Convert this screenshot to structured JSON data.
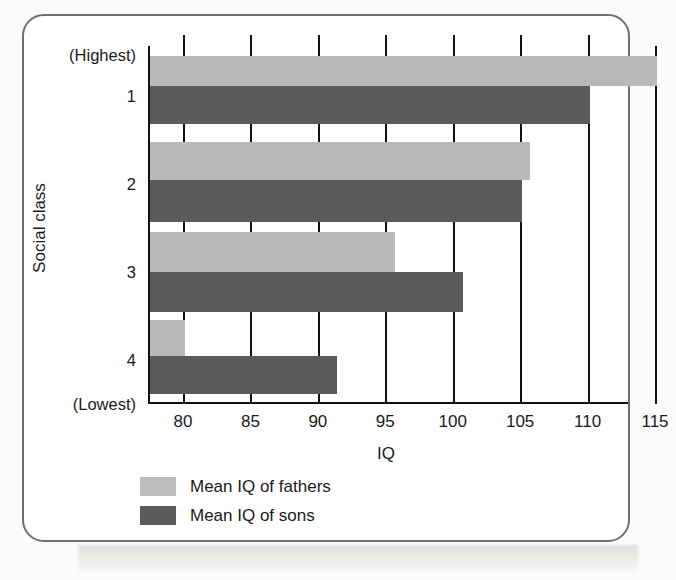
{
  "figure": {
    "frame_color": "#6f6f6f",
    "background": "#ffffff"
  },
  "colors": {
    "fathers": "#b9b9b9",
    "sons": "#5b5b5b",
    "axis": "#111111",
    "text": "#1a1a1a"
  },
  "axis_y": {
    "title": "Social class",
    "top_label": "(Highest)",
    "bottom_label": "(Lowest)",
    "class_labels": [
      "1",
      "2",
      "3",
      "4"
    ]
  },
  "axis_x": {
    "title": "IQ",
    "ticks": [
      "80",
      "85",
      "90",
      "95",
      "100",
      "105",
      "110",
      "115"
    ]
  },
  "legend": {
    "items": [
      {
        "label": "Mean IQ of fathers",
        "key": "fathers"
      },
      {
        "label": "Mean IQ of sons",
        "key": "sons"
      }
    ]
  },
  "chart_data": {
    "type": "bar",
    "orientation": "horizontal",
    "title": "",
    "xlabel": "IQ",
    "ylabel": "Social class",
    "categories": [
      "1",
      "2",
      "3",
      "4"
    ],
    "category_notes": {
      "1": "(Highest)",
      "4": "(Lowest)"
    },
    "series": [
      {
        "name": "Mean IQ of fathers",
        "color": "#b9b9b9",
        "values": [
          115.0,
          105.6,
          95.6,
          80.0
        ]
      },
      {
        "name": "Mean IQ of sons",
        "color": "#5b5b5b",
        "values": [
          110.0,
          105.0,
          100.6,
          91.3
        ]
      }
    ],
    "xlim": [
      77.2,
      115.5
    ],
    "xticks": [
      80,
      85,
      90,
      95,
      100,
      105,
      110,
      115
    ],
    "grid": "vertical",
    "legend_position": "bottom-left"
  }
}
